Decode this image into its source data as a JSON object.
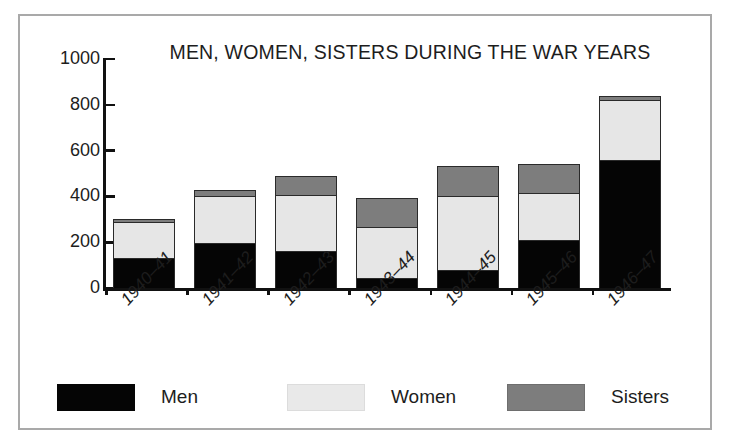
{
  "chart_data": {
    "type": "bar",
    "subtype": "stacked-bar",
    "title": "MEN, WOMEN, SISTERS DURING THE WAR YEARS",
    "xlabel": "",
    "ylabel": "",
    "ylim": [
      0,
      1000
    ],
    "yticks": [
      0,
      200,
      400,
      600,
      800,
      1000
    ],
    "ytick_labels": [
      "0",
      "200",
      "400",
      "600",
      "800",
      "1000"
    ],
    "grid": false,
    "legend_position": "bottom",
    "categories": [
      "1940–41",
      "1941–42",
      "1942–43",
      "1943–44",
      "1944–45",
      "1945–46",
      "1946–47"
    ],
    "series": [
      {
        "name": "Men",
        "color": "#050505",
        "values": [
          130,
          195,
          160,
          45,
          80,
          210,
          560
        ]
      },
      {
        "name": "Women",
        "color": "#e6e6e6",
        "values": [
          160,
          205,
          245,
          220,
          320,
          205,
          260
        ]
      },
      {
        "name": "Sisters",
        "color": "#7d7d7d",
        "values": [
          10,
          30,
          85,
          130,
          135,
          125,
          20
        ]
      }
    ],
    "totals": [
      300,
      430,
      490,
      395,
      535,
      540,
      840
    ]
  },
  "legend": {
    "items": [
      {
        "label": "Men",
        "swatch": "men"
      },
      {
        "label": "Women",
        "swatch": "women"
      },
      {
        "label": "Sisters",
        "swatch": "sisters"
      }
    ]
  }
}
